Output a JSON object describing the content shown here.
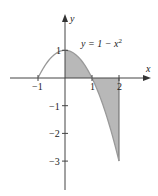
{
  "chart_data": {
    "type": "area",
    "title": "",
    "function_label": "y = 1 − x²",
    "function_label_main": "y = 1 − x",
    "function_label_exp": "2",
    "xlabel": "x",
    "ylabel": "y",
    "xlim": [
      -1.3,
      2.6
    ],
    "ylim": [
      -3.9,
      2.2
    ],
    "x_ticks": [
      {
        "value": -1,
        "label": "−1"
      },
      {
        "value": 1,
        "label": "1"
      },
      {
        "value": 2,
        "label": "2"
      }
    ],
    "y_ticks": [
      {
        "value": 1,
        "label": "1"
      },
      {
        "value": -1,
        "label": "−1"
      },
      {
        "value": -2,
        "label": "−2"
      },
      {
        "value": -3,
        "label": "−3"
      }
    ],
    "curve": {
      "name": "y = 1 − x²",
      "x_range": [
        -1,
        2
      ],
      "color": "#999999"
    },
    "shaded_region": {
      "description": "Area between curve and x-axis from x=0 to x=2",
      "x_range": [
        0,
        2
      ],
      "fill": "#b8b8b8"
    },
    "sample_points": [
      {
        "x": -1,
        "y": 0
      },
      {
        "x": -0.5,
        "y": 0.75
      },
      {
        "x": 0,
        "y": 1
      },
      {
        "x": 0.5,
        "y": 0.75
      },
      {
        "x": 1,
        "y": 0
      },
      {
        "x": 1.5,
        "y": -1.25
      },
      {
        "x": 2,
        "y": -3
      }
    ],
    "grid": false,
    "legend": "none"
  }
}
